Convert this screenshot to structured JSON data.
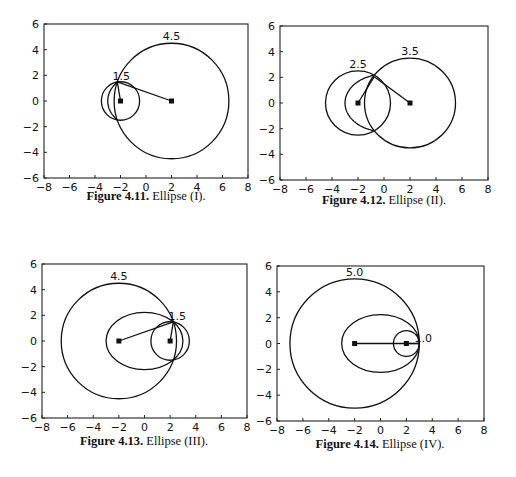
{
  "figures": [
    {
      "id": "fig-4-11",
      "caption_bold": "Figure 4.11.",
      "caption_rest": " Ellipse (I).",
      "box": {
        "left": 44,
        "right": 248,
        "top": 24,
        "bottom": 178
      },
      "caption_pos": {
        "x": 146,
        "y": 198
      }
    },
    {
      "id": "fig-4-12",
      "caption_bold": "Figure 4.12.",
      "caption_rest": " Ellipse (II).",
      "box": {
        "left": 280,
        "right": 488,
        "top": 26,
        "bottom": 180
      },
      "caption_pos": {
        "x": 384,
        "y": 202
      }
    },
    {
      "id": "fig-4-13",
      "caption_bold": "Figure 4.13.",
      "caption_rest": " Ellipse (III).",
      "box": {
        "left": 42,
        "right": 247,
        "top": 264,
        "bottom": 418
      },
      "caption_pos": {
        "x": 144,
        "y": 443
      }
    },
    {
      "id": "fig-4-14",
      "caption_bold": "Figure 4.14.",
      "caption_rest": " Ellipse (IV).",
      "box": {
        "left": 277,
        "right": 484,
        "top": 266,
        "bottom": 421
      },
      "caption_pos": {
        "x": 380,
        "y": 446
      }
    }
  ],
  "chart_data": [
    {
      "type": "line",
      "title": "Figure 4.11. Ellipse (I).",
      "xlim": [
        -8,
        8
      ],
      "ylim": [
        -6,
        6
      ],
      "xticks": [
        -8,
        -6,
        -4,
        -2,
        0,
        2,
        4,
        6,
        8
      ],
      "yticks": [
        -6,
        -4,
        -2,
        0,
        2,
        4,
        6
      ],
      "grid": false,
      "foci": [
        [
          -2,
          0
        ],
        [
          2,
          0
        ]
      ],
      "circles": [
        {
          "center": [
            -2,
            0
          ],
          "radius": 1.5,
          "label": "1.5"
        },
        {
          "center": [
            2,
            0
          ],
          "radius": 4.5,
          "label": "4.5"
        }
      ],
      "ellipse": {
        "center": [
          0,
          0
        ],
        "a": 3,
        "c": 2,
        "drawn": "partial-left-arc"
      },
      "intersection_point": [
        -2.25,
        1.49
      ],
      "annotations": [
        "1.5",
        "4.5"
      ]
    },
    {
      "type": "line",
      "title": "Figure 4.12. Ellipse (II).",
      "xlim": [
        -8,
        8
      ],
      "ylim": [
        -6,
        6
      ],
      "xticks": [
        -8,
        -6,
        -4,
        -2,
        0,
        2,
        4,
        6,
        8
      ],
      "yticks": [
        -6,
        -4,
        -2,
        0,
        2,
        4,
        6
      ],
      "grid": false,
      "foci": [
        [
          -2,
          0
        ],
        [
          2,
          0
        ]
      ],
      "circles": [
        {
          "center": [
            -2,
            0
          ],
          "radius": 2.5,
          "label": "2.5"
        },
        {
          "center": [
            2,
            0
          ],
          "radius": 3.5,
          "label": "3.5"
        }
      ],
      "ellipse": {
        "center": [
          0,
          0
        ],
        "a": 3,
        "c": 2,
        "drawn": "partial-left-arc"
      },
      "intersection_point": [
        -0.75,
        2.05
      ],
      "annotations": [
        "2.5",
        "3.5"
      ]
    },
    {
      "type": "line",
      "title": "Figure 4.13. Ellipse (III).",
      "xlim": [
        -8,
        8
      ],
      "ylim": [
        -6,
        6
      ],
      "xticks": [
        -8,
        -6,
        -4,
        -2,
        0,
        2,
        4,
        6,
        8
      ],
      "yticks": [
        -6,
        -4,
        -2,
        0,
        2,
        4,
        6
      ],
      "grid": false,
      "foci": [
        [
          -2,
          0
        ],
        [
          2,
          0
        ]
      ],
      "circles": [
        {
          "center": [
            -2,
            0
          ],
          "radius": 4.5,
          "label": "4.5"
        },
        {
          "center": [
            2,
            0
          ],
          "radius": 1.5,
          "label": "1.5"
        }
      ],
      "ellipse": {
        "center": [
          0,
          0
        ],
        "a": 3,
        "c": 2,
        "drawn": "full"
      },
      "intersection_point": [
        2.25,
        1.49
      ],
      "annotations": [
        "4.5",
        "1.5"
      ]
    },
    {
      "type": "line",
      "title": "Figure 4.14. Ellipse (IV).",
      "xlim": [
        -8,
        8
      ],
      "ylim": [
        -6,
        6
      ],
      "xticks": [
        -8,
        -6,
        -4,
        -2,
        0,
        2,
        4,
        6,
        8
      ],
      "yticks": [
        -6,
        -4,
        -2,
        0,
        2,
        4,
        6
      ],
      "grid": false,
      "foci": [
        [
          -2,
          0
        ],
        [
          2,
          0
        ]
      ],
      "circles": [
        {
          "center": [
            -2,
            0
          ],
          "radius": 5.0,
          "label": "5.0"
        },
        {
          "center": [
            2,
            0
          ],
          "radius": 1.0,
          "label": "1.0"
        }
      ],
      "ellipse": {
        "center": [
          0,
          0
        ],
        "a": 3,
        "c": 2,
        "drawn": "full"
      },
      "intersection_point": [
        3,
        0
      ],
      "annotations": [
        "5.0",
        "1.0"
      ]
    }
  ]
}
